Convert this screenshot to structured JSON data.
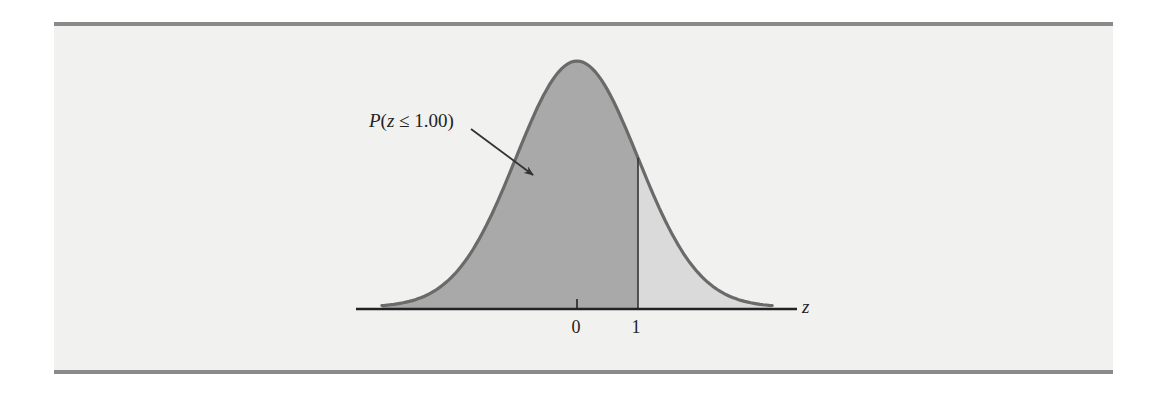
{
  "chart_data": {
    "type": "area",
    "title": "",
    "distribution": {
      "name": "standard normal",
      "mean": 0,
      "sd": 1
    },
    "xlabel": "z",
    "ylabel": "",
    "x_ticks": [
      {
        "value": 0,
        "label": "0"
      },
      {
        "value": 1,
        "label": "1"
      }
    ],
    "xlim": [
      -3.2,
      3.2
    ],
    "shaded_regions": [
      {
        "from": "-inf",
        "to": 1.0,
        "label": "P(z ≤ 1.00)",
        "value": 0.8413,
        "color": "#a9a9a9"
      },
      {
        "from": 1.0,
        "to": "inf",
        "label": "",
        "value": 0.1587,
        "color": "#dadada"
      }
    ],
    "annotations": [
      {
        "text": "P(z ≤ 1.00)",
        "points_to": "shaded area left of z = 1",
        "arrow": true
      }
    ],
    "vertical_lines": [
      {
        "x": 1.0
      }
    ],
    "grid": false,
    "legend": null
  },
  "labels": {
    "annotation": "P(z ≤ 1.00)",
    "axis": "z",
    "tick_0": "0",
    "tick_1": "1"
  },
  "colors": {
    "background": "#f1f1f0",
    "frame_rule": "#8a8a8a",
    "left_area": "#a9a9a9",
    "right_area": "#dadada",
    "curve": "#6a6a6a",
    "axis": "#222222"
  }
}
